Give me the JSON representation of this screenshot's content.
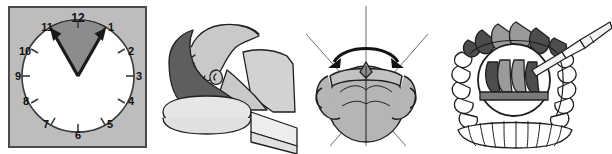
{
  "figure": {
    "panel_count": 4,
    "background_color": "#ffffff"
  },
  "panels": [
    {
      "id": "clock",
      "name": "clock-face-panel",
      "caption": "Clock face with shaded sector between 11 and 1 o'clock",
      "frame_fill": "#bdbdbd",
      "frame_stroke": "#4a4a4a",
      "dial_fill": "#ffffff",
      "dial_stroke": "#3a3a3a",
      "sector_fill": "#8c8c8c",
      "sector_stroke": "#2b2b2b",
      "hand_color": "#1a1a1a",
      "hour_numerals": [
        "12",
        "1",
        "2",
        "3",
        "4",
        "5",
        "6",
        "7",
        "8",
        "9",
        "10",
        "11"
      ],
      "sector_from_hour": "11",
      "sector_to_hour": "1",
      "tick_count": 12
    },
    {
      "id": "head-supine",
      "name": "supine-head-on-pillow-panel",
      "caption": "Head and neck in supine position resting on a pillow roll",
      "skin_fill": "#c9c9c9",
      "hair_fill": "#5e5e5e",
      "pillow_fill": "#e0e0e0",
      "outline_color": "#1f1f1f",
      "parts": [
        "forehead",
        "nose",
        "lips",
        "chin",
        "ear",
        "neck",
        "shoulder",
        "hair",
        "pillow",
        "bed-surface"
      ]
    },
    {
      "id": "skull-axial",
      "name": "skull-rotation-panel",
      "caption": "Skull viewed from above with vertical midline axis, diagonal reference lines and curved double-headed rotation arrow",
      "skull_fill": "#b5b5b5",
      "outline_color": "#1f1f1f",
      "axis_color": "#6e6e6e",
      "arrow_color": "#111111",
      "axis_lines": [
        "vertical-midline",
        "diagonal-left",
        "diagonal-right"
      ],
      "arrow_type": "double-headed-curved",
      "arrow_meaning": "rotation"
    },
    {
      "id": "dental-arches",
      "name": "dental-arch-probe-panel",
      "caption": "Upper dental arch with shaded anterior teeth, circular magnified inset and periodontal probe; lower arch shown below",
      "tooth_fill": "#ffffff",
      "shaded_tooth_fill": "#4d4d4d",
      "midtone_tooth_fill": "#9a9a9a",
      "outline_color": "#1f1f1f",
      "probe_fill": "#f2f2f2",
      "inset_shape": "circle",
      "upper_arch_teeth": 14,
      "lower_arch_teeth": 12,
      "instrument": "periodontal-probe"
    }
  ]
}
